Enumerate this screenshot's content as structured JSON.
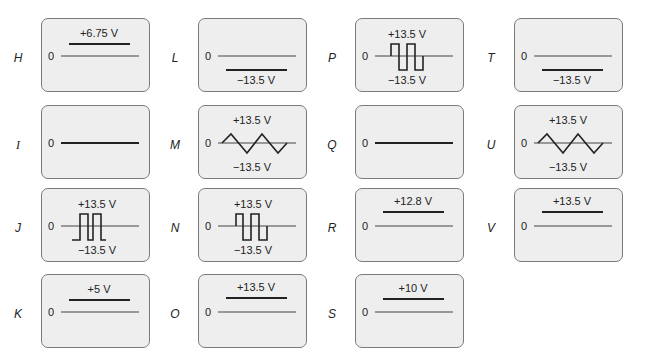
{
  "figure": {
    "zero_label": "0",
    "panels": [
      {
        "id": "H",
        "kind": "dc",
        "level_label": "+6.75 V",
        "sign": "pos",
        "level_volts": 6.75
      },
      {
        "id": "L",
        "kind": "dc",
        "level_label": "−13.5 V",
        "sign": "neg",
        "level_volts": -13.5
      },
      {
        "id": "P",
        "kind": "square",
        "top_label": "+13.5 V",
        "bottom_label": "−13.5 V"
      },
      {
        "id": "T",
        "kind": "dc",
        "level_label": "−13.5 V",
        "sign": "neg",
        "level_volts": -13.5
      },
      {
        "id": "I",
        "kind": "zero"
      },
      {
        "id": "M",
        "kind": "triangle",
        "top_label": "+13.5 V",
        "bottom_label": "−13.5 V"
      },
      {
        "id": "Q",
        "kind": "zero"
      },
      {
        "id": "U",
        "kind": "triangle",
        "top_label": "+13.5 V",
        "bottom_label": "−13.5 V"
      },
      {
        "id": "J",
        "kind": "pulse",
        "top_label": "+13.5 V",
        "bottom_label": "−13.5 V"
      },
      {
        "id": "N",
        "kind": "square",
        "top_label": "+13.5 V",
        "bottom_label": "−13.5 V"
      },
      {
        "id": "R",
        "kind": "dc",
        "level_label": "+12.8 V",
        "sign": "pos",
        "level_volts": 12.8
      },
      {
        "id": "V",
        "kind": "dc",
        "level_label": "+13.5 V",
        "sign": "pos",
        "level_volts": 13.5
      },
      {
        "id": "K",
        "kind": "dc",
        "level_label": "+5 V",
        "sign": "pos",
        "level_volts": 5
      },
      {
        "id": "O",
        "kind": "dc",
        "level_label": "+13.5 V",
        "sign": "pos",
        "level_volts": 13.5
      },
      {
        "id": "S",
        "kind": "dc",
        "level_label": "+10 V",
        "sign": "pos",
        "level_volts": 10
      }
    ]
  },
  "colors": {
    "panel_bg": "#eeeeee",
    "panel_border": "#7a7a7a",
    "trace": "#222222",
    "axis": "#444444"
  }
}
